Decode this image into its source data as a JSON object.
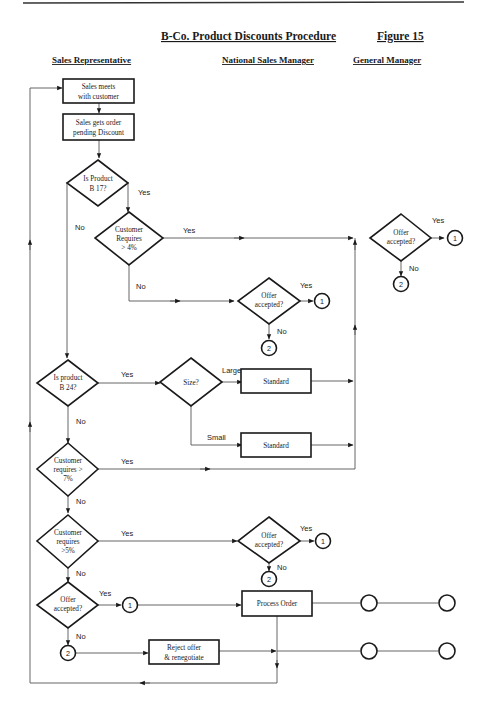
{
  "header": {
    "title": "B-Co.  Product Discounts Procedure",
    "figure": "Figure 15"
  },
  "lanes": {
    "sales_rep": "Sales Representative",
    "national_sales_manager": "National Sales Manager",
    "general_manager": "General Manager"
  },
  "nodes": {
    "meets_customer": [
      "Sales meets",
      "with customer"
    ],
    "gets_order": [
      "Sales gets order",
      "pending Discount"
    ],
    "is_product_b17": [
      "Is Product",
      "B 17?"
    ],
    "customer_requires_4": [
      "Customer",
      "Requires",
      "> 4%"
    ],
    "gm_offer_accepted": [
      "Offer",
      "accepted?"
    ],
    "nsm_offer_accepted_1": [
      "Offer",
      "accepted?"
    ],
    "is_product_b24": [
      "Is product",
      "B 24?"
    ],
    "size": [
      "Size?"
    ],
    "standard_large": [
      "Standard"
    ],
    "standard_small": [
      "Standard"
    ],
    "customer_requires_7": [
      "Customer",
      "requires >",
      "7%"
    ],
    "customer_requires_5": [
      "Customer",
      "requires",
      ">5%"
    ],
    "nsm_offer_accepted_2": [
      "Offer",
      "accepted?"
    ],
    "sr_offer_accepted": [
      "Offer",
      "accepted?"
    ],
    "process_order": [
      "Process Order"
    ],
    "reject_offer": [
      "Reject offer",
      "& renegotiate"
    ]
  },
  "connectors": {
    "one": "1",
    "two": "2"
  },
  "edge_labels": {
    "yes": "Yes",
    "no": "No",
    "large": "Large",
    "small": "Small"
  }
}
